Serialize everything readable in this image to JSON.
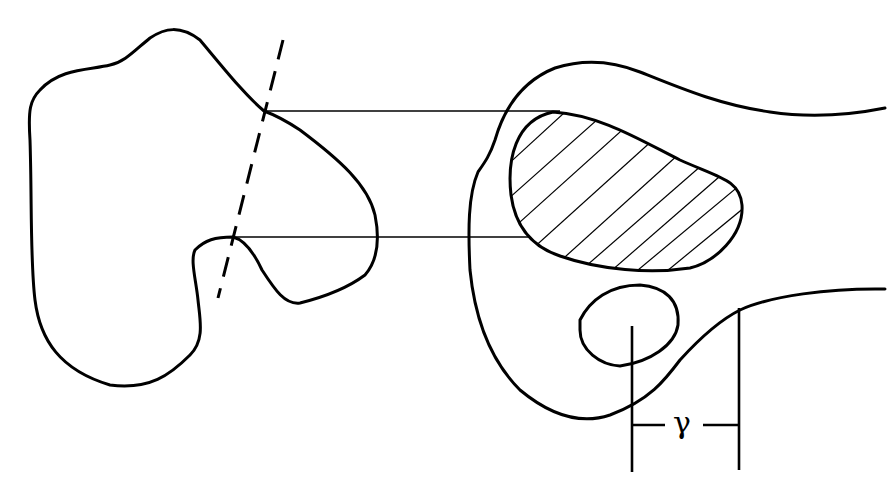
{
  "figure": {
    "type": "line-art diagram",
    "colors": {
      "ink": "#000000",
      "background": "#ffffff"
    },
    "left_view": {
      "description": "closed irregular outline with a notch, intersected by a dashed oblique cutting line",
      "dashed_line": {
        "from": [
          283,
          40
        ],
        "to": [
          218,
          298
        ]
      },
      "projection_points": [
        [
          264,
          111
        ],
        [
          233,
          237
        ]
      ]
    },
    "projection_lines": [
      {
        "y_start": 111,
        "y_end": 111,
        "x_from": 264,
        "x_to": 560
      },
      {
        "y_start": 237,
        "y_end": 237,
        "x_from": 233,
        "x_to": 530
      }
    ],
    "right_view": {
      "description": "cross-section with hatched region, small oval with center mark, and dimension",
      "hatched_region": true,
      "hatch_line_count": 11,
      "dimension": {
        "label": "γ",
        "left_extension_x": 632,
        "right_extension_x": 739,
        "y": 425
      }
    }
  }
}
